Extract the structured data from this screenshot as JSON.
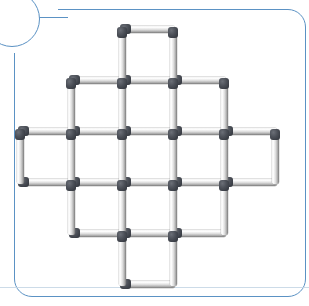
{
  "card": {
    "background_color": "#ffffff",
    "border_color": "#5b92c4",
    "border_radius_px": 18,
    "badge_shape": "circle"
  },
  "figure": {
    "name": "matchstick-puzzle-figure",
    "match_head_color": "#2d3138",
    "match_body_color": "#e2e2e2",
    "cell_size_px": 51,
    "grid_origin": {
      "x": 20,
      "y": 29
    },
    "columns_x": [
      20,
      71,
      122,
      173,
      224,
      275
    ],
    "rows_y": [
      29,
      80,
      131,
      182,
      233,
      284
    ],
    "rows_cell_counts": [
      1,
      3,
      5,
      3,
      1
    ],
    "total_squares": 13,
    "total_matches": 44,
    "horizontal_matches": [
      {
        "col": 2,
        "row": 0
      },
      {
        "col": 1,
        "row": 1
      },
      {
        "col": 2,
        "row": 1
      },
      {
        "col": 3,
        "row": 1
      },
      {
        "col": 0,
        "row": 2
      },
      {
        "col": 1,
        "row": 2
      },
      {
        "col": 2,
        "row": 2
      },
      {
        "col": 3,
        "row": 2
      },
      {
        "col": 4,
        "row": 2
      },
      {
        "col": 0,
        "row": 3
      },
      {
        "col": 1,
        "row": 3
      },
      {
        "col": 2,
        "row": 3
      },
      {
        "col": 3,
        "row": 3
      },
      {
        "col": 4,
        "row": 3
      },
      {
        "col": 1,
        "row": 4
      },
      {
        "col": 2,
        "row": 4
      },
      {
        "col": 3,
        "row": 4
      },
      {
        "col": 2,
        "row": 5
      }
    ],
    "vertical_matches": [
      {
        "col": 2,
        "row": 0
      },
      {
        "col": 3,
        "row": 0
      },
      {
        "col": 1,
        "row": 1
      },
      {
        "col": 2,
        "row": 1
      },
      {
        "col": 3,
        "row": 1
      },
      {
        "col": 4,
        "row": 1
      },
      {
        "col": 0,
        "row": 2
      },
      {
        "col": 1,
        "row": 2
      },
      {
        "col": 2,
        "row": 2
      },
      {
        "col": 3,
        "row": 2
      },
      {
        "col": 4,
        "row": 2
      },
      {
        "col": 5,
        "row": 2
      },
      {
        "col": 1,
        "row": 3
      },
      {
        "col": 2,
        "row": 3
      },
      {
        "col": 3,
        "row": 3
      },
      {
        "col": 4,
        "row": 3
      },
      {
        "col": 2,
        "row": 4
      },
      {
        "col": 3,
        "row": 4
      }
    ]
  }
}
